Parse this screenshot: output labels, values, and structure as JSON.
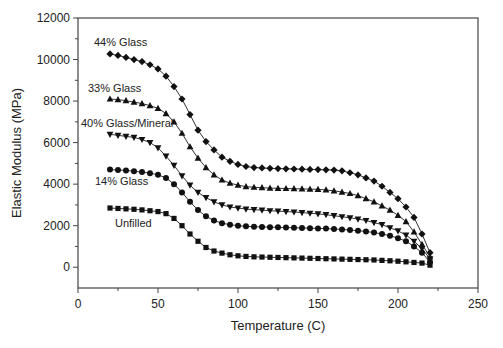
{
  "chart_data": {
    "type": "line",
    "title": "",
    "xlabel": "Temperature (C)",
    "ylabel": "Elastic Modulus (MPa)",
    "xlim": [
      0,
      250
    ],
    "ylim": [
      -1000,
      12000
    ],
    "x_ticks": [
      0,
      50,
      100,
      150,
      200,
      250
    ],
    "y_ticks": [
      0,
      2000,
      4000,
      6000,
      8000,
      10000,
      12000
    ],
    "grid": false,
    "legend": "inline labels near start of each curve",
    "x": [
      20,
      25,
      30,
      35,
      40,
      45,
      50,
      55,
      60,
      65,
      70,
      75,
      80,
      85,
      90,
      95,
      100,
      105,
      110,
      115,
      120,
      125,
      130,
      135,
      140,
      145,
      150,
      155,
      160,
      165,
      170,
      175,
      180,
      185,
      190,
      195,
      200,
      205,
      210,
      215,
      220
    ],
    "series": [
      {
        "name": "44% Glass",
        "marker": "diamond",
        "label_pos": [
          94,
          46
        ],
        "values": [
          10270,
          10200,
          10100,
          10000,
          9900,
          9750,
          9550,
          9200,
          8700,
          8100,
          7350,
          6600,
          6050,
          5650,
          5300,
          5100,
          4950,
          4850,
          4800,
          4780,
          4760,
          4750,
          4740,
          4730,
          4720,
          4710,
          4700,
          4690,
          4680,
          4640,
          4550,
          4450,
          4300,
          4150,
          3900,
          3600,
          3300,
          2900,
          2400,
          1600,
          700
        ]
      },
      {
        "name": "33% Glass",
        "marker": "triangle-up",
        "label_pos": [
          88,
          92
        ],
        "values": [
          8100,
          8070,
          8020,
          7950,
          7880,
          7780,
          7650,
          7400,
          7000,
          6450,
          5800,
          5250,
          4800,
          4450,
          4200,
          4050,
          3950,
          3880,
          3850,
          3830,
          3810,
          3800,
          3790,
          3780,
          3770,
          3760,
          3750,
          3720,
          3680,
          3620,
          3550,
          3450,
          3300,
          3150,
          2950,
          2750,
          2500,
          2200,
          1700,
          1100,
          500
        ]
      },
      {
        "name": "40% Glass/Mineral",
        "marker": "triangle-down",
        "label_pos": [
          81,
          127
        ],
        "values": [
          6400,
          6350,
          6300,
          6250,
          6150,
          6000,
          5750,
          5350,
          4900,
          4400,
          3950,
          3600,
          3350,
          3150,
          3000,
          2900,
          2850,
          2800,
          2770,
          2750,
          2720,
          2700,
          2680,
          2660,
          2630,
          2600,
          2570,
          2530,
          2480,
          2430,
          2380,
          2320,
          2250,
          2150,
          2050,
          1900,
          1750,
          1550,
          1250,
          900,
          400
        ]
      },
      {
        "name": "14% Glass",
        "marker": "circle",
        "label_pos": [
          95,
          185
        ],
        "values": [
          4700,
          4680,
          4660,
          4620,
          4580,
          4530,
          4450,
          4300,
          4000,
          3600,
          3150,
          2750,
          2450,
          2250,
          2120,
          2050,
          2000,
          1970,
          1950,
          1940,
          1930,
          1920,
          1910,
          1900,
          1890,
          1880,
          1870,
          1860,
          1840,
          1820,
          1790,
          1760,
          1720,
          1670,
          1600,
          1520,
          1400,
          1250,
          1000,
          700,
          250
        ]
      },
      {
        "name": "Unfilled",
        "marker": "square",
        "label_pos": [
          115,
          227
        ],
        "values": [
          2850,
          2830,
          2810,
          2790,
          2760,
          2720,
          2680,
          2580,
          2350,
          2000,
          1600,
          1250,
          950,
          780,
          680,
          600,
          550,
          520,
          500,
          490,
          480,
          470,
          460,
          450,
          440,
          430,
          420,
          410,
          400,
          390,
          380,
          370,
          360,
          350,
          330,
          310,
          290,
          260,
          230,
          200,
          100
        ]
      }
    ]
  },
  "style": {
    "line_color": "#333333",
    "marker_color": "#111111",
    "axis_color": "#444444"
  }
}
